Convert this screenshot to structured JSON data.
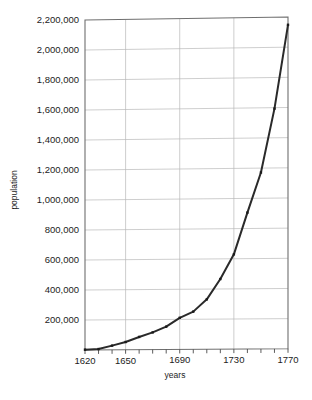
{
  "chart_data": {
    "type": "line",
    "title": "",
    "xlabel": "years",
    "ylabel": "population",
    "xlim": [
      1620,
      1770
    ],
    "ylim": [
      0,
      2200000
    ],
    "grid": true,
    "legend": "none",
    "x_tick_labels": [
      "1620",
      "1650",
      "1690",
      "1730",
      "1770"
    ],
    "x_tick_values": [
      1620,
      1650,
      1690,
      1730,
      1770
    ],
    "x_minor_tick_step": 10,
    "y_tick_labels": [
      "200,000",
      "400,000",
      "600,000",
      "800,000",
      "1,000,000",
      "1,200,000",
      "1,400,000",
      "1,600,000",
      "1,800,000",
      "2,000,000",
      "2,200,000"
    ],
    "y_tick_values": [
      200000,
      400000,
      600000,
      800000,
      1000000,
      1200000,
      1400000,
      1600000,
      1800000,
      2000000,
      2200000
    ],
    "series": [
      {
        "name": "population",
        "x": [
          1620,
          1630,
          1640,
          1650,
          1660,
          1670,
          1680,
          1690,
          1700,
          1710,
          1720,
          1730,
          1740,
          1750,
          1760,
          1770
        ],
        "values": [
          2300,
          5700,
          27900,
          51700,
          84800,
          114500,
          152100,
          210400,
          250900,
          331700,
          466200,
          629400,
          905600,
          1170800,
          1593600,
          2148100
        ]
      }
    ]
  },
  "axis": {
    "x_title": "years",
    "y_title": "population"
  }
}
